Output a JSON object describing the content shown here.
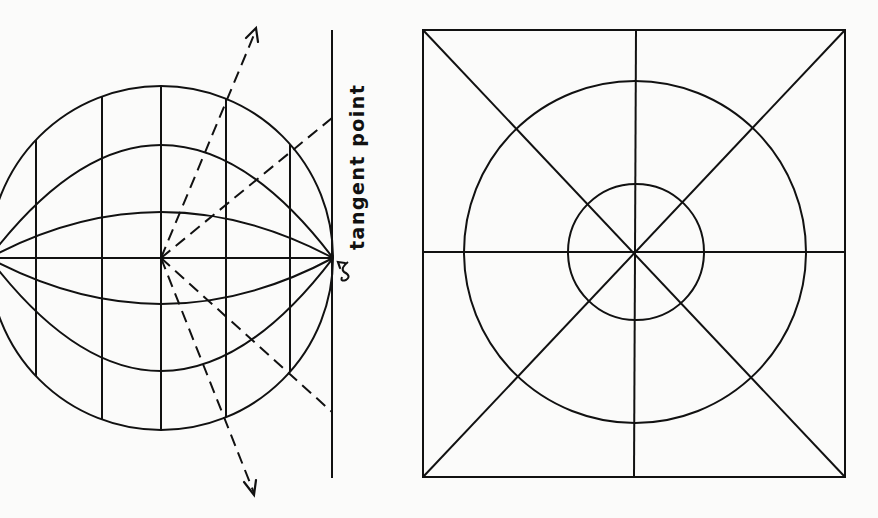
{
  "figure": {
    "left_panel": {
      "name": "globe-with-tangent-plane",
      "label": "tangent point",
      "globe": {
        "cx": 161,
        "cy": 258,
        "r": 172
      },
      "meridian_x": [
        36,
        102,
        161,
        226,
        290
      ],
      "parallel_peaks_above": [
        145,
        212
      ],
      "parallel_peaks_below": [
        305,
        370
      ],
      "tangent_line": {
        "x": 332,
        "y1": 30,
        "y2": 478
      },
      "projection_rays": [
        {
          "from": [
            161,
            258
          ],
          "to": [
            256,
            28
          ],
          "arrow": true
        },
        {
          "from": [
            161,
            258
          ],
          "to": [
            332,
            118
          ],
          "arrow": false
        },
        {
          "from": [
            161,
            258
          ],
          "to": [
            332,
            412
          ],
          "arrow": false
        },
        {
          "from": [
            161,
            258
          ],
          "to": [
            254,
            495
          ],
          "arrow": true
        }
      ]
    },
    "right_panel": {
      "name": "azimuthal-projection-grid",
      "square": {
        "x": 423,
        "y": 30,
        "w": 422,
        "h": 447
      },
      "center": [
        635,
        252
      ],
      "circles_r": [
        171,
        68
      ],
      "lines": [
        "vertical",
        "horizontal",
        "diagonal-nw-se",
        "diagonal-ne-sw"
      ]
    }
  }
}
